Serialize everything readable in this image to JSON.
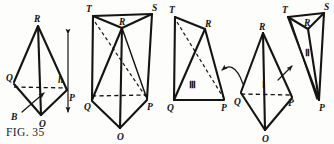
{
  "figure": {
    "caption": "FIG. 35",
    "panels": [
      {
        "id": "panel-1",
        "name": "tetrahedron-with-altitude",
        "labels": {
          "apex": "R",
          "left": "Q",
          "right": "P",
          "bottom": "O",
          "height": "h",
          "base": "B"
        }
      },
      {
        "id": "panel-2",
        "name": "triangular-prism",
        "labels": {
          "top_left": "T",
          "top_right": "S",
          "interior": "R",
          "bottom_left": "Q",
          "bottom_right": "P",
          "bottom": "O"
        }
      },
      {
        "id": "panel-3",
        "name": "piece-three",
        "labels": {
          "top_left": "T",
          "apex": "R",
          "bottom_left": "Q",
          "bottom_right": "P",
          "numeral": "Ⅲ"
        }
      },
      {
        "id": "panel-4",
        "name": "pieces-one-and-two",
        "labels": {
          "apex_left": "R",
          "top_left": "T",
          "top_right": "S",
          "interior": "R",
          "bottom_left": "Q",
          "bottom_mid": "P",
          "bottom_right": "P",
          "bottom": "O",
          "numeral_one": "Ⅰ",
          "numeral_two": "Ⅱ"
        }
      }
    ],
    "annotations": {
      "curved_arrow": "curved-arrow-left",
      "straight_arrow": "straight-arrow-up-right",
      "height_arrow": "double-headed-height-arrow",
      "base_arrow": "base-pointer-arrow"
    },
    "colors": {
      "ink": "#141414",
      "paper": "#fdfdfc"
    }
  }
}
